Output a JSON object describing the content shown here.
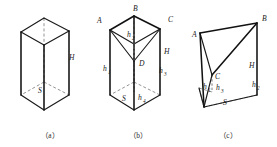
{
  "figure": {
    "title_visible": false,
    "panels": [
      {
        "id": "a",
        "caption": "（a）",
        "caption_x": 50,
        "caption_y": 138,
        "description": "right triangular prism",
        "labels": [
          {
            "name": "height-label-H",
            "text": "H",
            "x": 69,
            "y": 60
          },
          {
            "name": "base-area-label-S",
            "text": "S",
            "x": 38,
            "y": 93
          }
        ]
      },
      {
        "id": "b",
        "caption": "（b）",
        "caption_x": 138,
        "caption_y": 138,
        "description": "triangular prism divided from interior point D",
        "labels": [
          {
            "name": "vertex-label-A",
            "text": "A",
            "x": 97,
            "y": 23
          },
          {
            "name": "vertex-label-B",
            "text": "B",
            "x": 133,
            "y": 11
          },
          {
            "name": "vertex-label-C",
            "text": "C",
            "x": 168,
            "y": 22
          },
          {
            "name": "vertex-label-D",
            "text": "D",
            "x": 139,
            "y": 66
          },
          {
            "name": "height-label-H",
            "text": "H",
            "x": 164,
            "y": 54
          },
          {
            "name": "base-area-label-S",
            "text": "S",
            "x": 122,
            "y": 101
          }
        ],
        "height_labels": [
          {
            "name": "height-label-h1",
            "base": "h",
            "sub": "1",
            "x": 103,
            "y": 71
          },
          {
            "name": "height-label-h2",
            "base": "h",
            "sub": "2",
            "x": 127,
            "y": 37
          },
          {
            "name": "height-label-h3",
            "base": "h",
            "sub": "3",
            "x": 159,
            "y": 73
          },
          {
            "name": "height-label-h4",
            "base": "h",
            "sub": "4",
            "x": 138,
            "y": 100
          }
        ]
      },
      {
        "id": "c",
        "caption": "（c）",
        "caption_x": 228,
        "caption_y": 138,
        "description": "oblique triangular prism with apex C inside",
        "labels": [
          {
            "name": "vertex-label-A",
            "text": "A",
            "x": 192,
            "y": 37
          },
          {
            "name": "vertex-label-B",
            "text": "B",
            "x": 262,
            "y": 21
          },
          {
            "name": "vertex-label-C",
            "text": "C",
            "x": 215,
            "y": 79
          },
          {
            "name": "height-label-H",
            "text": "H",
            "x": 249,
            "y": 68
          },
          {
            "name": "base-area-label-S",
            "text": "S",
            "x": 223,
            "y": 105
          }
        ],
        "height_labels": [
          {
            "name": "height-label-h1",
            "base": "h",
            "sub": "1",
            "x": 203,
            "y": 89
          },
          {
            "name": "height-label-h3",
            "base": "h",
            "sub": "3",
            "x": 216,
            "y": 90
          },
          {
            "name": "height-label-h2",
            "base": "h",
            "sub": "2",
            "x": 252,
            "y": 87
          }
        ]
      }
    ],
    "colors": {
      "solid_edge": "#1a1a1a",
      "hidden_edge": "#8d8d8d",
      "background": "#ffffff",
      "label_text": "#1a1a1a"
    }
  }
}
